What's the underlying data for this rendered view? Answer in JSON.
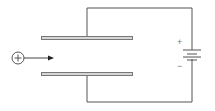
{
  "diagram": {
    "particle": {
      "symbol": "+",
      "icon": "positive-charge-icon"
    },
    "battery": {
      "plus_label": "+",
      "minus_label": "−"
    },
    "colors": {
      "wire": "#555555",
      "plate_fill": "#d6d6d6",
      "plate_stroke": "#777777",
      "text": "#777777"
    }
  }
}
